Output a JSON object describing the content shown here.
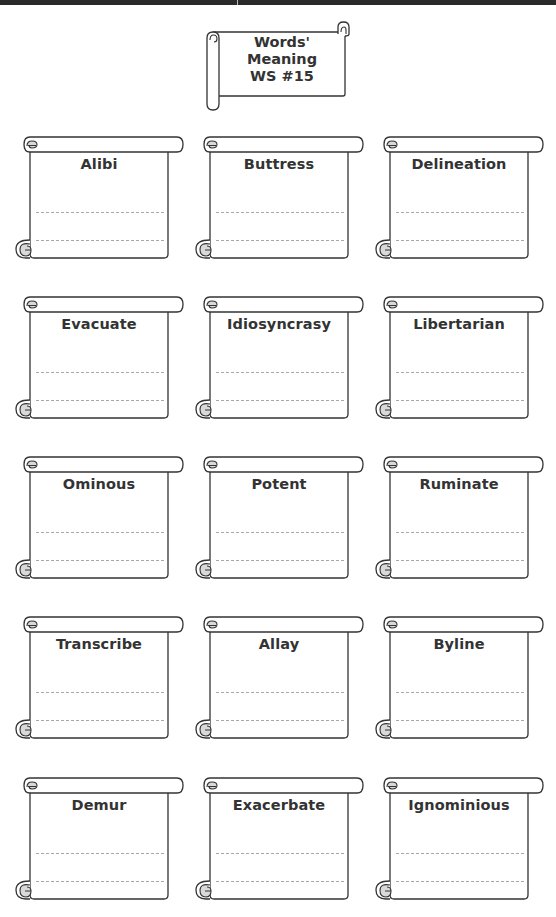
{
  "header": {
    "title_lines": [
      "Words'",
      "Meaning",
      "WS #15"
    ]
  },
  "worksheet": {
    "line_color": "#a8a8a8",
    "stroke_color": "#333333",
    "curl_fill": "#d9d9d9",
    "cards": [
      {
        "word": "Alibi"
      },
      {
        "word": "Buttress"
      },
      {
        "word": "Delineation"
      },
      {
        "word": "Evacuate"
      },
      {
        "word": "Idiosyncrasy"
      },
      {
        "word": "Libertarian"
      },
      {
        "word": "Ominous"
      },
      {
        "word": "Potent"
      },
      {
        "word": "Ruminate"
      },
      {
        "word": "Transcribe"
      },
      {
        "word": "Allay"
      },
      {
        "word": "Byline"
      },
      {
        "word": "Demur"
      },
      {
        "word": "Exacerbate"
      },
      {
        "word": "Ignominious"
      }
    ]
  }
}
